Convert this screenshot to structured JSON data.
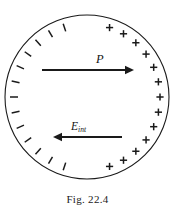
{
  "figure": {
    "caption": "Fig. 22.4",
    "background_color": "#ffffff",
    "stroke_color": "#1a1a1a"
  },
  "diagram": {
    "circle": {
      "center_x": 87,
      "center_y": 97,
      "radius": 82,
      "stroke_width": 1.1,
      "fill": "none"
    },
    "negative_charges": {
      "symbol": "minus-sign",
      "count": 13,
      "side": "left",
      "start_angle_deg": 108,
      "end_angle_deg": 252,
      "inset": 9,
      "dash_length": 8,
      "stroke_width": 1.5
    },
    "positive_charges": {
      "symbol": "plus-sign",
      "count": 13,
      "side": "right",
      "start_angle_deg": -72,
      "end_angle_deg": 72,
      "inset": 9,
      "arm_length": 3.6,
      "stroke_width": 1.5
    },
    "vectors": [
      {
        "id": "polarization",
        "label": "P",
        "label_subscript": "",
        "direction": "right",
        "x_start": 42,
        "x_end": 134,
        "y": 70,
        "stroke_width": 2.0,
        "head_length": 9,
        "head_half_width": 4.2
      },
      {
        "id": "internal-field",
        "label": "E",
        "label_subscript": "int",
        "direction": "left",
        "x_start": 122,
        "x_end": 53,
        "y": 137,
        "stroke_width": 2.0,
        "head_length": 9,
        "head_half_width": 4.2
      }
    ]
  }
}
